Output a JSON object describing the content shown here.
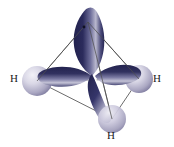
{
  "figure": {
    "background_color": "#ffffff",
    "width": 174,
    "height": 147
  },
  "colors": {
    "lobe_dark": "#262654",
    "lobe_mid": "#4a4a7d",
    "lobe_highlight": "#c9c9dd",
    "sphere_light": "#e2e1ec",
    "sphere_mid": "#b7b4cc",
    "sphere_dark": "#6f6b92",
    "wireframe": "#5a5a5a",
    "label_text": "#1a1a1a"
  },
  "labels": {
    "left": "H",
    "right": "H",
    "bottom": "H"
  },
  "atoms": [
    {
      "name": "hydrogen-left",
      "label": "H",
      "cx": 37,
      "cy": 81,
      "r": 15
    },
    {
      "name": "hydrogen-right",
      "label": "H",
      "cx": 139,
      "cy": 79,
      "r": 14
    },
    {
      "name": "hydrogen-bottom",
      "label": "H",
      "cx": 112,
      "cy": 119,
      "r": 14
    }
  ],
  "orbitals": [
    {
      "name": "lobe-top",
      "direction": "up"
    },
    {
      "name": "lobe-left",
      "direction": "left"
    },
    {
      "name": "lobe-right",
      "direction": "right"
    },
    {
      "name": "lobe-bottom-front",
      "direction": "down-front"
    }
  ],
  "geometry": {
    "center": {
      "x": 95,
      "y": 77
    },
    "apex": {
      "x": 88,
      "y": 22
    },
    "vertices": [
      {
        "name": "apex",
        "x": 88,
        "y": 22
      },
      {
        "name": "left-vertex",
        "x": 37,
        "y": 81
      },
      {
        "name": "right-vertex",
        "x": 139,
        "y": 79
      },
      {
        "name": "front-vertex",
        "x": 112,
        "y": 119
      }
    ],
    "shape": "tetrahedron"
  }
}
